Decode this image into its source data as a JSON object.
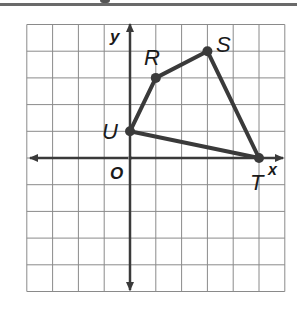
{
  "figure": {
    "axis_x_label": "x",
    "axis_y_label": "y",
    "origin_label": "O",
    "grid": {
      "x_min": -4,
      "x_max": 6,
      "y_min": -5,
      "y_max": 5
    },
    "vertices": [
      {
        "label": "R",
        "x": 1,
        "y": 3
      },
      {
        "label": "S",
        "x": 3,
        "y": 4
      },
      {
        "label": "T",
        "x": 5,
        "y": 0
      },
      {
        "label": "U",
        "x": 0,
        "y": 1
      }
    ],
    "colors": {
      "grid": "#8a8a8a",
      "axes": "#3a3a3a",
      "polygon": "#3a3a3a",
      "top_rule": "#6a6a6a"
    }
  },
  "labels": {
    "R": "R",
    "S": "S",
    "T": "T",
    "U": "U",
    "x": "x",
    "y": "y",
    "O": "O"
  }
}
